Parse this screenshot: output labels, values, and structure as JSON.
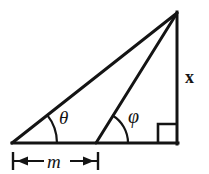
{
  "figure": {
    "kind": "geometry-diagram",
    "background_color": "#ffffff",
    "stroke_color": "#141414",
    "labels": {
      "angle_theta": "θ",
      "angle_phi": "φ",
      "vertical_side": "x",
      "base_distance": "m"
    },
    "geometry": {
      "apex": {
        "x": 177,
        "y": 13
      },
      "left_vertex": {
        "x": 12,
        "y": 143
      },
      "mid_vertex": {
        "x": 96,
        "y": 143
      },
      "right_vertex": {
        "x": 177,
        "y": 143
      },
      "baseline_y": 143,
      "theta_arc_radius": 45,
      "phi_arc_radius": 32,
      "right_angle_marker_size": 19,
      "dimension_line_y": 161,
      "dimension_start_x": 13,
      "dimension_end_x": 98
    }
  }
}
